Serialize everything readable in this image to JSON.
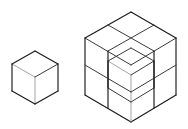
{
  "scene": {
    "title": "Isometric cube comparison diagram",
    "background_color": "#ffffff",
    "width": 188,
    "height": 129,
    "line_color_dark": "#1a1a1a",
    "line_color_mid": "#3a3a3a",
    "line_color_light": "#9a9a9a",
    "face_fill": "#ffffff"
  },
  "figures": [
    {
      "id": "unit-cube",
      "label": "Single unit cube",
      "shape": "cube",
      "units": 1,
      "grid": "1x1x1",
      "projection": "isometric",
      "visible_faces": [
        "top",
        "left",
        "right"
      ],
      "bounds": {
        "x": 12,
        "y": 51,
        "width": 46,
        "height": 53
      },
      "vertices": {
        "top_apex": [
          35,
          51
        ],
        "top_left": [
          12,
          64
        ],
        "top_right": [
          58,
          64
        ],
        "center": [
          35,
          77
        ],
        "bottom_left": [
          12,
          91
        ],
        "bottom_right": [
          58,
          91
        ],
        "bottom_apex": [
          35,
          104
        ]
      }
    },
    {
      "id": "composite-cube",
      "label": "Two by two by two cube assembly with front top cube removed",
      "shape": "cube-assembly",
      "units": 7,
      "grid": "2x2x2",
      "projection": "isometric",
      "removed_cell": "front-top-center",
      "recess_contains_inner_cube": true,
      "visible_faces": [
        "top",
        "left",
        "right",
        "recess"
      ],
      "bounds": {
        "x": 85,
        "y": 12,
        "width": 91,
        "height": 110
      },
      "vertices": {
        "top_apex": [
          131,
          12
        ],
        "top_left": [
          85,
          38
        ],
        "top_right": [
          176,
          38
        ],
        "top_center": [
          131,
          48
        ],
        "mid_left": [
          85,
          65
        ],
        "mid_right": [
          176,
          65
        ],
        "front_mid": [
          131,
          75
        ],
        "bottom_left": [
          85,
          95
        ],
        "bottom_right": [
          176,
          95
        ],
        "bottom_apex": [
          131,
          122
        ]
      }
    }
  ]
}
